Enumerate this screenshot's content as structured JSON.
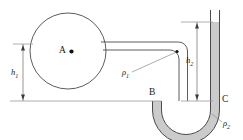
{
  "figure": {
    "type": "engineering-diagram",
    "background_color": "#ffffff",
    "line_color": "#4a4a4a",
    "fluid_color": "#b9b9b9",
    "text_color": "#1a1a1a"
  },
  "labels": {
    "tank_point": "A",
    "point_b": "B",
    "point_c": "C",
    "height_1": "h",
    "height_1_sub": "1",
    "height_2": "h",
    "height_2_sub": "2",
    "density_1": "ρ",
    "density_1_sub": "1",
    "density_2": "ρ",
    "density_2_sub": "2"
  },
  "geometry": {
    "tank_center_x": 68,
    "tank_center_y": 51,
    "tank_radius": 38,
    "baseline_y": 101,
    "pipe_top_y": 42,
    "pipe_bottom_y": 50,
    "u_left_tube_x": 167,
    "u_right_tube_x": 215,
    "tube_top_y": 10,
    "fluid_level_y": 22,
    "u_bottom_y": 133
  }
}
